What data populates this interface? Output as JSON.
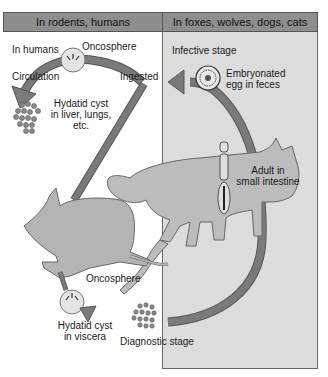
{
  "panels": {
    "left": {
      "header": "In rodents, humans"
    },
    "right": {
      "header": "In foxes, wolves, dogs, cats"
    }
  },
  "labels": {
    "in_humans": "In humans",
    "oncosphere_top": "Oncosphere",
    "circulation": "Circulation",
    "ingested": "Ingested",
    "hydatid_liver_1": "Hydatid cyst",
    "hydatid_liver_2": "in liver, lungs,",
    "hydatid_liver_3": "etc.",
    "infective_stage": "Infective stage",
    "embryonated_1": "Embryonated",
    "embryonated_2": "egg in feces",
    "adult_1": "Adult in",
    "adult_2": "small intestine",
    "oncosphere_bottom": "Oncosphere",
    "hydatid_viscera_1": "Hydatid cyst",
    "hydatid_viscera_2": "in viscera",
    "diagnostic_stage": "Diagnostic stage"
  },
  "colors": {
    "header_bg": "#8e8e8e",
    "right_panel_bg": "#dcdcdc",
    "arrow": "#7a7a7a",
    "animal": "#b4b4b4"
  }
}
